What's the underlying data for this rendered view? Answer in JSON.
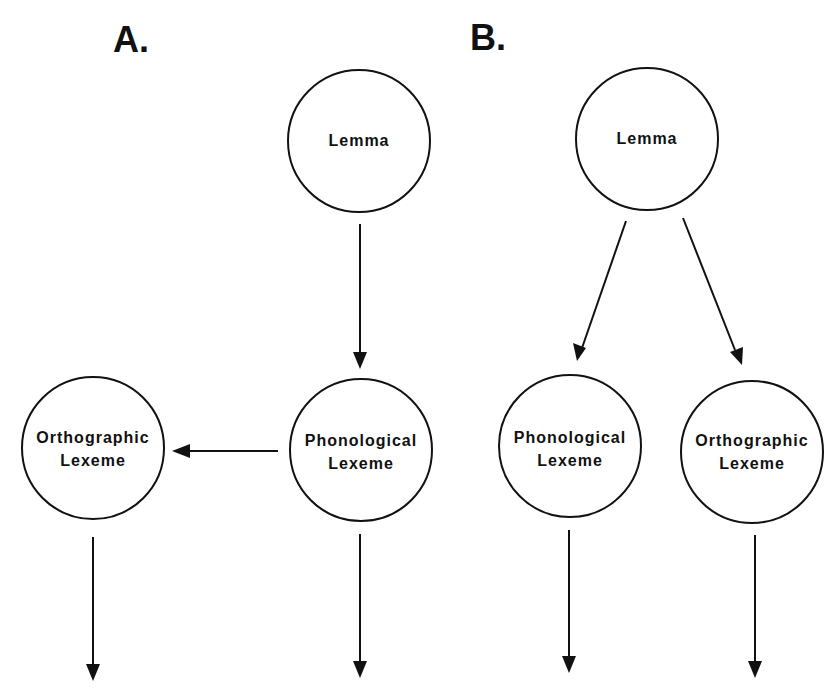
{
  "panels": {
    "a": {
      "label": "A.",
      "nodes": {
        "lemma": {
          "line1": "Lemma",
          "line2": ""
        },
        "phonological": {
          "line1": "Phonological",
          "line2": "Lexeme"
        },
        "orthographic": {
          "line1": "Orthographic",
          "line2": "Lexeme"
        }
      },
      "edges": [
        {
          "from": "Lemma",
          "to": "Phonological Lexeme"
        },
        {
          "from": "Phonological Lexeme",
          "to": "Orthographic Lexeme"
        },
        {
          "from": "Orthographic Lexeme",
          "to": "output"
        },
        {
          "from": "Phonological Lexeme",
          "to": "output"
        }
      ]
    },
    "b": {
      "label": "B.",
      "nodes": {
        "lemma": {
          "line1": "Lemma",
          "line2": ""
        },
        "phonological": {
          "line1": "Phonological",
          "line2": "Lexeme"
        },
        "orthographic": {
          "line1": "Orthographic",
          "line2": "Lexeme"
        }
      },
      "edges": [
        {
          "from": "Lemma",
          "to": "Phonological Lexeme"
        },
        {
          "from": "Lemma",
          "to": "Orthographic Lexeme"
        },
        {
          "from": "Phonological Lexeme",
          "to": "output"
        },
        {
          "from": "Orthographic Lexeme",
          "to": "output"
        }
      ]
    }
  },
  "colors": {
    "stroke": "#111111",
    "background": "#ffffff"
  }
}
